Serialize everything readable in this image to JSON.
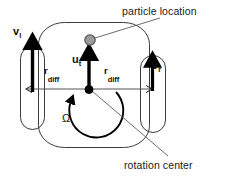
{
  "figure": {
    "background_color": "#ffffff",
    "width": 228,
    "height": 177
  },
  "callouts": {
    "particle_location": "particle location",
    "rotation_center": "rotation center"
  },
  "symbols": {
    "v_left_base": "v",
    "v_left_sub": "l",
    "v_right_base": "v",
    "v_right_sub": "r",
    "u_base": "u",
    "u_sub": "t",
    "r_base": "r",
    "r_sub": "diff",
    "omega": "Ω"
  },
  "colors": {
    "outline": "#3c3c3c",
    "arrow": "#000000",
    "particle_fill": "#9a9a9a",
    "particle_stroke": "#4a4a4a",
    "center_dot": "#000000",
    "leader_line": "#5a5a5a",
    "axis_line": "#555555",
    "text": "#1a1a1a"
  },
  "shapes": {
    "body": {
      "x": 38,
      "y": 22,
      "width": 112,
      "height": 126,
      "label": "robot-body"
    },
    "wheel_left": {
      "x": 20,
      "y": 46,
      "width": 25,
      "height": 84,
      "label": "left-wheel"
    },
    "wheel_right": {
      "x": 140,
      "y": 55,
      "width": 26,
      "height": 78,
      "label": "right-wheel"
    },
    "particle": {
      "cx": 90,
      "cy": 40,
      "r": 5.5
    },
    "rotation_center": {
      "cx": 89,
      "cy": 89,
      "r": 4
    }
  }
}
